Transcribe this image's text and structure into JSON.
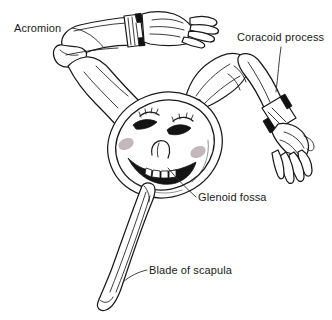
{
  "figure": {
    "alt": "Line drawing of a scapula drawn as a cartoon character with two arms, a smiling oval face and a tapering blade",
    "style": "black and white pen line art",
    "background_color": "#ffffff",
    "line_color": "#1a1a1a",
    "blush_color": "#b9aab0",
    "cuff_color": "#111111"
  },
  "labels": [
    {
      "id": "acromion",
      "text": "Acromion",
      "position": "top-left",
      "leader_line": "points right and down toward the rounded bone end of the upper-left arm"
    },
    {
      "id": "coracoid-process",
      "text": "Coracoid process",
      "position": "top-right",
      "leader_line": "points down toward the cuffed wrist of the right arm"
    },
    {
      "id": "glenoid-fossa",
      "text": "Glenoid fossa",
      "position": "middle-right",
      "leader_line": "points up and left toward the oval face"
    },
    {
      "id": "blade-of-scapula",
      "text": "Blade of scapula",
      "position": "bottom-center",
      "leader_line": "points left toward the long tapered blade"
    }
  ],
  "parts": [
    {
      "id": "acromion-arm",
      "name": "Upper left arm with cuffed wrist and open hand"
    },
    {
      "id": "coracoid-arm",
      "name": "Right arm bent at elbow with cuffed wrist and open hand"
    },
    {
      "id": "glenoid-face",
      "name": "Oval face with winking eyes, lashes, nose, blush and toothy smile"
    },
    {
      "id": "scapula-blade",
      "name": "Long tapered blade extending down and left"
    }
  ],
  "face": {
    "expression": "smiling with closed winking eyes",
    "features": [
      "left-eye",
      "right-eye",
      "left-eyelashes",
      "right-eyelashes",
      "nose",
      "mouth",
      "teeth",
      "left-blush",
      "right-blush"
    ]
  }
}
